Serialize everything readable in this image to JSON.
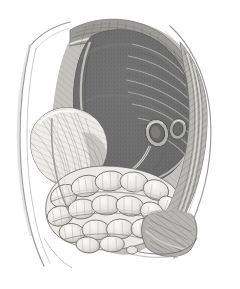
{
  "plate": {
    "kind": "anatomical-engraving",
    "title": "Abdominal cavity, sagittal dissection",
    "medium": "steel engraving, hatched and stippled",
    "background_color": "#ffffff",
    "ink_color": "#4a4a4a",
    "caption": "",
    "canvas": {
      "width": 240,
      "height": 289
    }
  },
  "palette": {
    "paper": "#ffffff",
    "outline": "#8d8d8d",
    "light_tissue": "#e9e7e4",
    "mid_tissue": "#b9b7b3",
    "dark_organ": "#6e6e6e",
    "darkest": "#4d4d4d",
    "hatch": "#6a6a6a",
    "stipple": "#7c7c7c"
  },
  "regions": [
    {
      "id": "body-wall-left",
      "label": "Anterior body wall (left contour)",
      "tone": "#ffffff",
      "note": "thin double contour line sweeping from upper left down to hip"
    },
    {
      "id": "body-wall-right-flap",
      "label": "Reflected abdominal wall flap (right)",
      "tone": "#b9b7b3",
      "note": "folded-back flap with long diagonal hatching"
    },
    {
      "id": "diaphragm",
      "label": "Diaphragm dome",
      "tone": "#8f8d89",
      "note": "arched crest with dense parallel muscle-fibre hatching"
    },
    {
      "id": "liver",
      "label": "Liver (large dark mass)",
      "tone": "#6e6e6e",
      "note": "dominant stippled dark organ filling upper cavity"
    },
    {
      "id": "stomach",
      "label": "Stomach",
      "tone": "#e4e2de",
      "note": "pale rounded organ at left with radiating striations"
    },
    {
      "id": "vessel-rings",
      "label": "Cut vessel rings",
      "tone": "#d8d6d2",
      "note": "two adjacent oval ring sections at centre-right"
    },
    {
      "id": "small-intestine",
      "label": "Small intestine coils",
      "tone": "#efedea",
      "note": "mass of looped convoluted bowel across lower centre"
    },
    {
      "id": "pelvis",
      "label": "Pelvic brim / hip",
      "tone": "#a9a7a3",
      "note": "hatched bony rim at lower right"
    }
  ]
}
